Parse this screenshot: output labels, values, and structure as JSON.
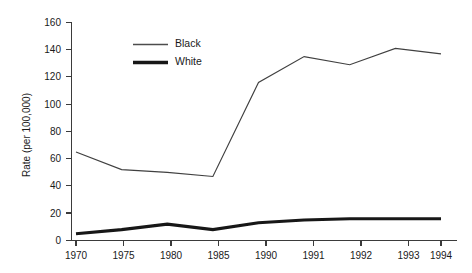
{
  "chart_data": {
    "type": "line",
    "title": "",
    "subtitle": "",
    "xlabel": "",
    "ylabel": "Rate (per 100,000)",
    "categories": [
      "1970",
      "1975",
      "1980",
      "1985",
      "1990",
      "1991",
      "1992",
      "1993",
      "1994"
    ],
    "x": [
      1970,
      1975,
      1980,
      1985,
      1990,
      1991,
      1992,
      1993,
      1994
    ],
    "series": [
      {
        "name": "Black",
        "style": "thin-line",
        "color": "#404040",
        "values": [
          65,
          52,
          50,
          47,
          116,
          135,
          129,
          141,
          137
        ]
      },
      {
        "name": "White",
        "style": "thick-line",
        "color": "#171717",
        "values": [
          5,
          8,
          12,
          8,
          13,
          15,
          16,
          16,
          16
        ]
      }
    ],
    "ylim": [
      0,
      160
    ],
    "yticks": [
      0,
      20,
      40,
      60,
      80,
      100,
      120,
      140,
      160
    ],
    "ytick_labels": [
      "0",
      "20",
      "40",
      "60",
      "80",
      "100",
      "120",
      "140",
      "160"
    ],
    "xtick_labels": [
      "1970",
      "1975",
      "1980",
      "1985",
      "1990",
      "1991",
      "1992",
      "1993",
      "1994"
    ],
    "grid": false,
    "x_axis_scale": "categorical-evenly-spaced",
    "legend": {
      "position": "inside-upper-left",
      "entries": [
        "Black",
        "White"
      ]
    },
    "annotations": []
  },
  "legend": {
    "items": [
      {
        "label": "Black"
      },
      {
        "label": "White"
      }
    ]
  },
  "axes": {
    "y_title": "Rate (per 100,000)",
    "y_labels": [
      "160",
      "140",
      "120",
      "100",
      "80",
      "60",
      "40",
      "20",
      "0"
    ],
    "x_labels": [
      "1970",
      "1975",
      "1980",
      "1985",
      "1990",
      "1991",
      "1992",
      "1993",
      "1994"
    ]
  },
  "colors": {
    "axis": "#3b3b3b",
    "text": "#1a1a1a",
    "series_black": "#404040",
    "series_white": "#171717",
    "background": "#ffffff"
  }
}
